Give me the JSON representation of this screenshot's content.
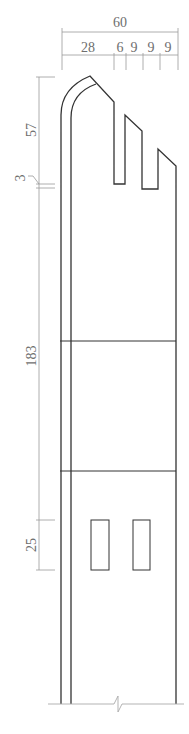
{
  "drawing": {
    "type": "elevation drawing of tower wall with stepped crenellated top and two windows",
    "colors": {
      "object_line": "#333333",
      "dimension_line": "#9a9a9a",
      "text": "#6e6e6e"
    }
  },
  "dimensions": {
    "top_overall": "60",
    "top_segments": [
      "28",
      "6",
      "9",
      "9",
      "9"
    ],
    "left_vertical": [
      "57",
      "3",
      "183",
      "25"
    ]
  }
}
